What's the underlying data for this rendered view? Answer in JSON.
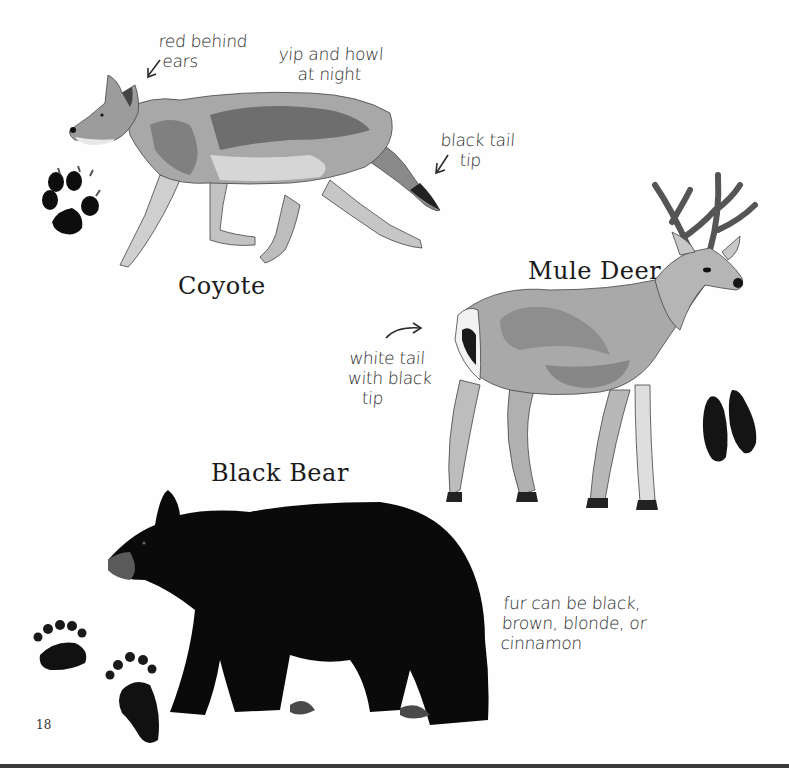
{
  "page": {
    "number": "18",
    "background": "#fefefe"
  },
  "animals": [
    {
      "name": "Coyote",
      "notes": [
        "red behind\n ears",
        "yip and howl\n    at night",
        "black tail\n    tip"
      ],
      "track_icon": "coyote-paw-print-icon"
    },
    {
      "name": "Mule Deer",
      "notes": [
        "white tail\nwith black\n   tip"
      ],
      "track_icon": "deer-hoof-print-icon"
    },
    {
      "name": "Black Bear",
      "notes": [
        "fur can be black,\nbrown, blonde, or\ncinnamon"
      ],
      "track_icon": "bear-paw-print-icon"
    }
  ],
  "colors": {
    "ink": "#1a1a1a",
    "fur_light": "#c9c9c9",
    "fur_mid": "#9a9a9a",
    "fur_dark": "#6b6b6b",
    "bear": "#0c0c0c",
    "antler": "#5a5a5a"
  }
}
